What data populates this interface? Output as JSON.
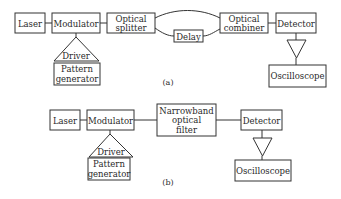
{
  "diagram_a": {
    "caption": "(a)",
    "laser": "Laser",
    "modulator": "Modulator",
    "splitter": [
      "Optical",
      "splitter"
    ],
    "delay": "Delay",
    "combiner": [
      "Optical",
      "combiner"
    ],
    "detector": "Detector",
    "driver": "Driver",
    "pattern_generator": [
      "Pattern",
      "generator"
    ],
    "oscilloscope": "Oscilloscope"
  },
  "diagram_b": {
    "caption": "(b)",
    "laser": "Laser",
    "modulator": "Modulator",
    "filter": [
      "Narrowband",
      "optical",
      "filter"
    ],
    "detector": "Detector",
    "driver": "Driver",
    "pattern_generator": [
      "Pattern",
      "generator"
    ],
    "oscilloscope": "Oscilloscope"
  },
  "colors": {
    "line": "#333333",
    "text": "#2a2a2a",
    "background": "#ffffff"
  }
}
